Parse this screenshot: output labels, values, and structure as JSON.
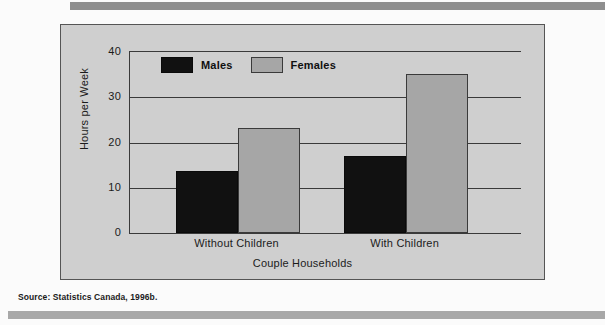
{
  "figure": {
    "source_note": "Source: Statistics Canada, 1996b.",
    "panel_bg": "#cfcfcf",
    "rule_color_top": "#8e8e8e",
    "rule_color_bottom": "#a8a8a8"
  },
  "chart_data": {
    "type": "bar",
    "title": "",
    "subtitle": "",
    "xlabel": "Couple Households",
    "ylabel": "Hours per Week",
    "categories": [
      "Without Children",
      "With Children"
    ],
    "series": [
      {
        "name": "Males",
        "color": "#111111",
        "values": [
          13.8,
          17.0
        ]
      },
      {
        "name": "Females",
        "color": "#a6a6a6",
        "values": [
          23.3,
          35.2
        ]
      }
    ],
    "ylim": [
      0,
      40
    ],
    "yticks": [
      0,
      10,
      20,
      30,
      40
    ],
    "ytick_labels": [
      "0",
      "10",
      "20",
      "30",
      "40"
    ],
    "grid": true,
    "grid_axis": "y",
    "legend": {
      "position": "upper-left-inside",
      "entries": [
        "Males",
        "Females"
      ]
    }
  }
}
